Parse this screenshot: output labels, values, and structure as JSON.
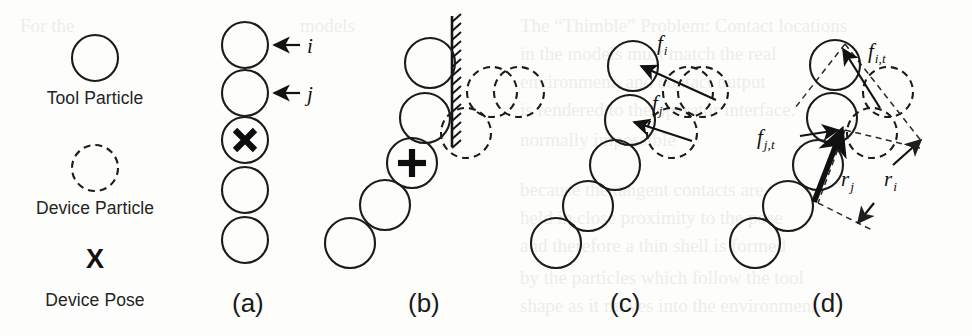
{
  "figure": {
    "title_caption": "",
    "background_color": "#fdfdfb",
    "ink_color": "#1b1b1b",
    "legend": {
      "items": [
        {
          "id": "tool-particle",
          "label": "Tool Particle",
          "glyph": "solid-circle"
        },
        {
          "id": "device-particle",
          "label": "Device Particle",
          "glyph": "dashed-circle"
        },
        {
          "id": "device-pose",
          "label": "Device Pose",
          "glyph": "x-marker",
          "symbol": "X"
        }
      ]
    },
    "panels": [
      {
        "id": "panel-a",
        "label": "(a)",
        "label_x": 232,
        "label_y": 312,
        "description": "Vertical chain of five tool particles with index arrows",
        "particles": [
          {
            "cx": 245,
            "cy": 45,
            "r": 23,
            "style": "solid"
          },
          {
            "cx": 245,
            "cy": 93,
            "r": 23,
            "style": "solid"
          },
          {
            "cx": 245,
            "cy": 140,
            "r": 23,
            "style": "solid",
            "marker": "X"
          },
          {
            "cx": 245,
            "cy": 190,
            "r": 23,
            "style": "solid"
          },
          {
            "cx": 245,
            "cy": 240,
            "r": 23,
            "style": "solid"
          }
        ],
        "annotations": [
          {
            "id": "index-i",
            "text": "i",
            "x": 307,
            "y": 52,
            "arrow_from": [
              300,
              45
            ],
            "arrow_to": [
              272,
              45
            ]
          },
          {
            "id": "index-j",
            "text": "j",
            "x": 307,
            "y": 100,
            "arrow_from": [
              300,
              93
            ],
            "arrow_to": [
              272,
              93
            ]
          }
        ]
      },
      {
        "id": "panel-b",
        "label": "(b)",
        "label_x": 408,
        "label_y": 312,
        "description": "Diagonal tool chain contacting a hatched wall, device particles displaced",
        "particles": [
          {
            "cx": 430,
            "cy": 63,
            "r": 25,
            "style": "solid"
          },
          {
            "cx": 425,
            "cy": 118,
            "r": 25,
            "style": "solid"
          },
          {
            "cx": 412,
            "cy": 163,
            "r": 25,
            "style": "solid",
            "marker": "plus-x"
          },
          {
            "cx": 385,
            "cy": 205,
            "r": 25,
            "style": "solid"
          },
          {
            "cx": 350,
            "cy": 243,
            "r": 25,
            "style": "solid"
          }
        ],
        "device_particles": [
          {
            "cx": 492,
            "cy": 92,
            "r": 25,
            "style": "dashed"
          },
          {
            "cx": 466,
            "cy": 133,
            "r": 25,
            "style": "dashed"
          }
        ],
        "wall": {
          "x": 452,
          "y_top": 16,
          "y_bottom": 147,
          "hatch_side": "right"
        }
      },
      {
        "id": "panel-c",
        "label": "(c)",
        "label_x": 610,
        "label_y": 312,
        "description": "Contact forces f_i and f_j applied to tool particles",
        "particles": [
          {
            "cx": 633,
            "cy": 66,
            "r": 25,
            "style": "solid"
          },
          {
            "cx": 630,
            "cy": 120,
            "r": 25,
            "style": "solid"
          },
          {
            "cx": 615,
            "cy": 165,
            "r": 25,
            "style": "solid"
          },
          {
            "cx": 588,
            "cy": 206,
            "r": 25,
            "style": "solid"
          },
          {
            "cx": 556,
            "cy": 243,
            "r": 25,
            "style": "solid"
          }
        ],
        "device_particles": [
          {
            "cx": 519,
            "cy": 92,
            "r": 25,
            "style": "dashed"
          },
          {
            "cx": 688,
            "cy": 92,
            "r": 25,
            "style": "dashed"
          },
          {
            "cx": 672,
            "cy": 133,
            "r": 25,
            "style": "dashed"
          }
        ],
        "force_arrows": [
          {
            "id": "f-i",
            "label": "f",
            "sub": "i",
            "label_x": 661,
            "label_y": 48,
            "from": [
              712,
              98
            ],
            "to": [
              637,
              63
            ]
          },
          {
            "id": "f-j",
            "label": "f",
            "sub": "j",
            "label_x": 657,
            "label_y": 108,
            "from": [
              690,
              140
            ],
            "to": [
              628,
              120
            ]
          }
        ]
      },
      {
        "id": "panel-d",
        "label": "(d)",
        "label_x": 812,
        "label_y": 312,
        "description": "Tangential forces f_i,t and f_j,t with lever arms r_i and r_j about the device pose",
        "particles": [
          {
            "cx": 835,
            "cy": 65,
            "r": 25,
            "style": "solid"
          },
          {
            "cx": 832,
            "cy": 118,
            "r": 25,
            "style": "solid"
          },
          {
            "cx": 818,
            "cy": 165,
            "r": 25,
            "style": "solid"
          },
          {
            "cx": 788,
            "cy": 206,
            "r": 25,
            "style": "solid"
          },
          {
            "cx": 755,
            "cy": 243,
            "r": 25,
            "style": "solid"
          }
        ],
        "device_particles": [
          {
            "cx": 703,
            "cy": 92,
            "r": 25,
            "style": "dashed"
          },
          {
            "cx": 888,
            "cy": 92,
            "r": 25,
            "style": "dashed"
          },
          {
            "cx": 872,
            "cy": 133,
            "r": 25,
            "style": "dashed"
          }
        ],
        "force_arrows": [
          {
            "id": "f-i-t",
            "label": "f",
            "sub": "i,t",
            "label_x": 873,
            "label_y": 55,
            "from": [
              876,
              105
            ],
            "to": [
              845,
              48
            ]
          },
          {
            "id": "f-j-t",
            "label": "f",
            "sub": "j,t",
            "label_x": 764,
            "label_y": 140,
            "from": [
              818,
              200
            ],
            "to": [
              845,
              130
            ]
          }
        ],
        "lever_arms": [
          {
            "id": "r-j",
            "label": "r",
            "sub": "j",
            "label_x": 846,
            "label_y": 178,
            "from": [
              862,
              130
            ],
            "to": [
              822,
              205
            ]
          },
          {
            "id": "r-i",
            "label": "r",
            "sub": "i",
            "label_x": 888,
            "label_y": 178,
            "from": [
              865,
              185
            ],
            "to": [
              918,
              145
            ]
          }
        ]
      }
    ]
  }
}
